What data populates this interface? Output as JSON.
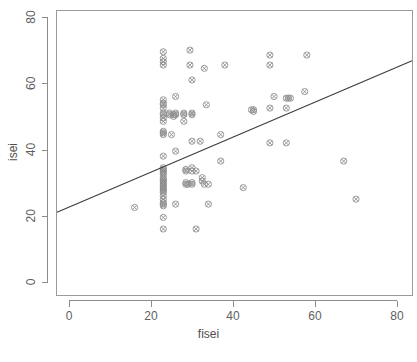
{
  "chart_data": {
    "type": "scatter",
    "title": "",
    "xlabel": "fisei",
    "ylabel": "isei",
    "xlim": [
      -4,
      84
    ],
    "ylim": [
      -5,
      84
    ],
    "xticks": [
      0,
      20,
      40,
      60,
      80
    ],
    "yticks": [
      0,
      20,
      40,
      60,
      80
    ],
    "xticklabels": [
      "0",
      "20",
      "40",
      "60",
      "80"
    ],
    "yticklabels": [
      "0",
      "20",
      "40",
      "60",
      "80"
    ],
    "grid": false,
    "legend": null,
    "marker_style": "circle-x",
    "points": [
      [
        16,
        22.5
      ],
      [
        23,
        69.5
      ],
      [
        23,
        67.5
      ],
      [
        23,
        66.5
      ],
      [
        23,
        65.5
      ],
      [
        23,
        55
      ],
      [
        23,
        54
      ],
      [
        23,
        53.5
      ],
      [
        23,
        52.5
      ],
      [
        23,
        51
      ],
      [
        23,
        50.5
      ],
      [
        23,
        49.5
      ],
      [
        23,
        48.5
      ],
      [
        23,
        45.5
      ],
      [
        23,
        45
      ],
      [
        23,
        44.5
      ],
      [
        23,
        38
      ],
      [
        23,
        34.5
      ],
      [
        23,
        34
      ],
      [
        23,
        33.5
      ],
      [
        23,
        33
      ],
      [
        23,
        32.5
      ],
      [
        23,
        31.5
      ],
      [
        23,
        31
      ],
      [
        23,
        30.5
      ],
      [
        23,
        30
      ],
      [
        23,
        29.5
      ],
      [
        23,
        29
      ],
      [
        23,
        28.5
      ],
      [
        23,
        28
      ],
      [
        23,
        27.5
      ],
      [
        23,
        27
      ],
      [
        23,
        26
      ],
      [
        23,
        25
      ],
      [
        23,
        24
      ],
      [
        23,
        23.5
      ],
      [
        23,
        23
      ],
      [
        23,
        19.5
      ],
      [
        23,
        16
      ],
      [
        24.5,
        51
      ],
      [
        24.5,
        50.5
      ],
      [
        25,
        44.5
      ],
      [
        25.5,
        50.5
      ],
      [
        25.5,
        50
      ],
      [
        26,
        56
      ],
      [
        26,
        51
      ],
      [
        26,
        50.5
      ],
      [
        26,
        39.5
      ],
      [
        26,
        23.5
      ],
      [
        28,
        51
      ],
      [
        28,
        50.5
      ],
      [
        28,
        48.5
      ],
      [
        28.5,
        34
      ],
      [
        28.5,
        33.5
      ],
      [
        28.5,
        30
      ],
      [
        28.5,
        29.5
      ],
      [
        29,
        29.5
      ],
      [
        29.5,
        70
      ],
      [
        29.5,
        65.5
      ],
      [
        30,
        61
      ],
      [
        30,
        51
      ],
      [
        30,
        50.5
      ],
      [
        30,
        42.5
      ],
      [
        30,
        34.5
      ],
      [
        30,
        33.5
      ],
      [
        30,
        30
      ],
      [
        30,
        29.5
      ],
      [
        31,
        33.5
      ],
      [
        31,
        16
      ],
      [
        32,
        42.5
      ],
      [
        32.5,
        31.5
      ],
      [
        32.5,
        30.5
      ],
      [
        33,
        64.5
      ],
      [
        33,
        29.5
      ],
      [
        33.5,
        53.5
      ],
      [
        34,
        29.5
      ],
      [
        34,
        23.5
      ],
      [
        37,
        44.5
      ],
      [
        37,
        36.5
      ],
      [
        38,
        65.5
      ],
      [
        42.5,
        28.5
      ],
      [
        44.5,
        52
      ],
      [
        45,
        51.5
      ],
      [
        45,
        52
      ],
      [
        49,
        68.5
      ],
      [
        49,
        65.5
      ],
      [
        49,
        52.5
      ],
      [
        49,
        42
      ],
      [
        50,
        56
      ],
      [
        53,
        55.5
      ],
      [
        53.5,
        55.5
      ],
      [
        54,
        55.5
      ],
      [
        53,
        52.5
      ],
      [
        53,
        42
      ],
      [
        57.5,
        57.5
      ],
      [
        58,
        68.5
      ],
      [
        67,
        36.5
      ],
      [
        70,
        25
      ]
    ],
    "regression_line": {
      "x_start": -4,
      "y_start": 20.5,
      "x_end": 84,
      "y_end": 67.0
    }
  },
  "caption": {
    "text": ""
  }
}
